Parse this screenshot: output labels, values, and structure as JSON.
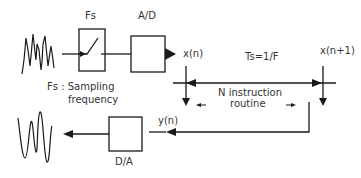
{
  "diagram": {
    "blocks": {
      "sampler": {
        "label": "Fs"
      },
      "adc": {
        "label": "A/D"
      },
      "dac": {
        "label": "D/A"
      }
    },
    "notes": {
      "fs_line1": "Fs : Sampling",
      "fs_line2": "frequency"
    },
    "timeline": {
      "start_sample": "x(n)",
      "next_sample": "x(n+1)",
      "period": "Ts=1/F",
      "routine_line1": "N instruction",
      "routine_line2": "routine",
      "output": "y(n)"
    },
    "signals": {
      "input": "analog-input-waveform",
      "output": "analog-output-waveform"
    },
    "colors": {
      "line": "#1a1a1a",
      "text": "#333333",
      "background": "#ffffff"
    }
  }
}
